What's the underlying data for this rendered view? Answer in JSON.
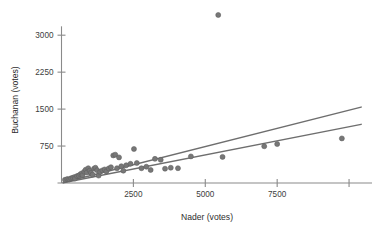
{
  "chart_data": {
    "type": "scatter",
    "title": "",
    "xlabel": "Nader (votes)",
    "ylabel": "Buchanan (votes)",
    "xlim": [
      0,
      10450
    ],
    "ylim": [
      0,
      3420
    ],
    "xticks": [
      2500,
      5000,
      7500,
      10000
    ],
    "xticklabels": [
      "2500",
      "5000",
      "7500",
      ""
    ],
    "yticks": [
      750,
      1500,
      2250,
      3000
    ],
    "yticklabels": [
      "750",
      "1500",
      "2250",
      "3000"
    ],
    "grid": false,
    "legend": null,
    "point_color": "#777777",
    "line_color": "#6e6e6e",
    "axis_color": "#8a8a8a",
    "points": [
      {
        "x": 120,
        "y": 65
      },
      {
        "x": 200,
        "y": 80
      },
      {
        "x": 270,
        "y": 75
      },
      {
        "x": 330,
        "y": 95
      },
      {
        "x": 390,
        "y": 105
      },
      {
        "x": 450,
        "y": 120
      },
      {
        "x": 470,
        "y": 90
      },
      {
        "x": 540,
        "y": 140
      },
      {
        "x": 600,
        "y": 150
      },
      {
        "x": 650,
        "y": 175
      },
      {
        "x": 700,
        "y": 195
      },
      {
        "x": 730,
        "y": 160
      },
      {
        "x": 790,
        "y": 230
      },
      {
        "x": 840,
        "y": 270
      },
      {
        "x": 880,
        "y": 215
      },
      {
        "x": 930,
        "y": 300
      },
      {
        "x": 980,
        "y": 250
      },
      {
        "x": 1020,
        "y": 205
      },
      {
        "x": 1080,
        "y": 170
      },
      {
        "x": 1130,
        "y": 290
      },
      {
        "x": 1180,
        "y": 310
      },
      {
        "x": 1240,
        "y": 260
      },
      {
        "x": 1290,
        "y": 150
      },
      {
        "x": 1340,
        "y": 225
      },
      {
        "x": 1420,
        "y": 255
      },
      {
        "x": 1500,
        "y": 275
      },
      {
        "x": 1560,
        "y": 235
      },
      {
        "x": 1640,
        "y": 295
      },
      {
        "x": 1720,
        "y": 320
      },
      {
        "x": 1800,
        "y": 560
      },
      {
        "x": 1870,
        "y": 575
      },
      {
        "x": 1930,
        "y": 300
      },
      {
        "x": 2000,
        "y": 520
      },
      {
        "x": 2080,
        "y": 340
      },
      {
        "x": 2150,
        "y": 250
      },
      {
        "x": 2250,
        "y": 360
      },
      {
        "x": 2400,
        "y": 390
      },
      {
        "x": 2520,
        "y": 690
      },
      {
        "x": 2620,
        "y": 405
      },
      {
        "x": 2780,
        "y": 300
      },
      {
        "x": 2950,
        "y": 330
      },
      {
        "x": 3100,
        "y": 265
      },
      {
        "x": 3250,
        "y": 490
      },
      {
        "x": 3450,
        "y": 470
      },
      {
        "x": 3600,
        "y": 290
      },
      {
        "x": 3800,
        "y": 310
      },
      {
        "x": 4050,
        "y": 300
      },
      {
        "x": 4500,
        "y": 540
      },
      {
        "x": 5450,
        "y": 3410
      },
      {
        "x": 5600,
        "y": 530
      },
      {
        "x": 7050,
        "y": 745
      },
      {
        "x": 7500,
        "y": 790
      },
      {
        "x": 9750,
        "y": 905
      }
    ],
    "lines": [
      {
        "name": "upper-fit-line",
        "x1": 62,
        "y1": 10,
        "x2": 10420,
        "y2": 1540
      },
      {
        "name": "lower-fit-line",
        "x1": 62,
        "y1": 5,
        "x2": 10420,
        "y2": 1190
      }
    ]
  }
}
